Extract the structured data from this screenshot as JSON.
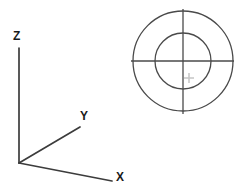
{
  "view": {
    "background_color": "#ffffff",
    "width": 246,
    "height": 191,
    "drawing_type": "cad-2d-sketch"
  },
  "axis_indicator": {
    "name": "ucs-axis-tripod",
    "line_color": "#3c3c3c",
    "line_width": 1.6,
    "origin": {
      "x": 19,
      "y": 163
    },
    "axes": [
      {
        "id": "z",
        "label": "Z",
        "end_x": 19,
        "end_y": 48,
        "label_x": 13,
        "label_y": 30
      },
      {
        "id": "y",
        "label": "Y",
        "end_x": 80,
        "end_y": 127,
        "label_x": 80,
        "label_y": 110
      },
      {
        "id": "x",
        "label": "X",
        "end_x": 112,
        "end_y": 181,
        "label_x": 116,
        "label_y": 171
      }
    ]
  },
  "geometry": {
    "name": "concentric-circles-with-centerlines",
    "stroke_color": "#4a4a4a",
    "stroke_width": 1.2,
    "center": {
      "x": 183,
      "y": 61
    },
    "circles": [
      {
        "id": "outer-circle",
        "radius": 50
      },
      {
        "id": "inner-circle",
        "radius": 28
      }
    ],
    "centerlines": [
      {
        "id": "horizontal-centerline",
        "x1": 131,
        "y1": 61,
        "x2": 234,
        "y2": 61
      },
      {
        "id": "vertical-centerline",
        "x1": 183,
        "y1": 9,
        "x2": 183,
        "y2": 114
      }
    ]
  },
  "cursor": {
    "name": "crosshair-pickbox",
    "color": "#c8c8c8",
    "x": 189,
    "y": 78,
    "arm_length": 5
  }
}
